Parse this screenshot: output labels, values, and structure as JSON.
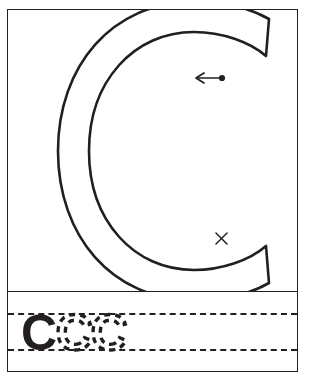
{
  "worksheet": {
    "letter": "C",
    "letter_case": "uppercase",
    "title": "Letter C Tracing Worksheet",
    "stroke_color": "#231f20",
    "background_color": "#ffffff",
    "border_color": "#231f20"
  },
  "trace_panel": {
    "name": "large-letter-tracing-area",
    "letter_outline_label": "C",
    "start_marker": {
      "name": "stroke-start-dot",
      "symbol": "●",
      "x": 215,
      "y": 70
    },
    "direction_arrow": {
      "name": "stroke-direction-arrow",
      "symbol": "←",
      "direction": "left",
      "from_x": 215,
      "from_y": 70,
      "to_x": 186,
      "to_y": 70
    },
    "end_marker": {
      "name": "stroke-end-cross",
      "symbol": "×",
      "label": "x",
      "x": 215,
      "y": 230
    }
  },
  "practice_panel": {
    "name": "practice-writing-band",
    "guide_lines": [
      "top-dashed-guide",
      "bottom-dashed-guide"
    ],
    "solid_example_letter": "C",
    "dashed_trace_letters": [
      "C",
      "C"
    ],
    "blank_practice_slots": 6
  }
}
